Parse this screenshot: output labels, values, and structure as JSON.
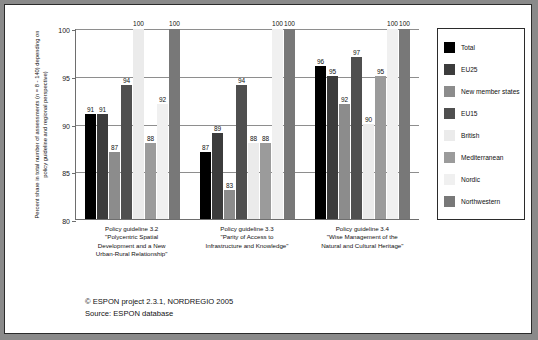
{
  "chart_data": {
    "type": "bar",
    "title": "",
    "xlabel": "",
    "ylabel": "Percent share in total number of assessments (n = 8 - 140) depending on policy guideline and regional perspective)",
    "ylim": [
      80,
      100
    ],
    "yticks": [
      80,
      85,
      90,
      95,
      100
    ],
    "ytick_labels": [
      "80",
      "85",
      "90",
      "95",
      "100"
    ],
    "grid": true,
    "legend_position": "right",
    "categories": [
      "Policy guideline 3.2 \"Polycentric Spatial Development and a New Urban-Rural Relationship\"",
      "Policy guideline 3.3 \"Parity of Access to Infrastructure and Knowledge\"",
      "Policy guideline 3.4 \"Wise Management of the Natural and Cultural Heritage\""
    ],
    "category_lines": [
      [
        "Policy guideline 3.2",
        "\"Polycentric Spatial",
        "Development and a New",
        "Urban-Rural Relationship\""
      ],
      [
        "Policy guideline 3.3",
        "\"Parity of Access to",
        "Infrastructure and Knowledge\""
      ],
      [
        "Policy guideline 3.4",
        "\"Wise Management of the",
        "Natural and Cultural Heritage\""
      ]
    ],
    "series": [
      {
        "name": "Total",
        "color": "#000000",
        "values": [
          91,
          87,
          96
        ]
      },
      {
        "name": "EU25",
        "color": "#3c3c3c",
        "values": [
          91,
          89,
          95
        ]
      },
      {
        "name": "New member states",
        "color": "#8c8c8c",
        "values": [
          87,
          83,
          92
        ]
      },
      {
        "name": "EU15",
        "color": "#4f4f4f",
        "values": [
          94,
          94,
          97
        ]
      },
      {
        "name": "British",
        "color": "#ebebeb",
        "values": [
          100,
          88,
          90
        ]
      },
      {
        "name": "Mediterranean",
        "color": "#9b9b9b",
        "values": [
          88,
          88,
          95
        ]
      },
      {
        "name": "Nordic",
        "color": "#f0f0f0",
        "values": [
          92,
          100,
          100
        ]
      },
      {
        "name": "Northwestern",
        "color": "#787878",
        "values": [
          100,
          100,
          100
        ]
      }
    ]
  },
  "legend": {
    "items": [
      {
        "label": "Total",
        "color": "#000000"
      },
      {
        "label": "EU25",
        "color": "#3c3c3c"
      },
      {
        "label": "New member states",
        "color": "#8c8c8c"
      },
      {
        "label": "EU15",
        "color": "#4f4f4f"
      },
      {
        "label": "British",
        "color": "#ebebeb"
      },
      {
        "label": "Mediterranean",
        "color": "#9b9b9b"
      },
      {
        "label": "Nordic",
        "color": "#f0f0f0"
      },
      {
        "label": "Northwestern",
        "color": "#787878"
      }
    ]
  },
  "footer": {
    "copyright": "© ESPON project 2.3.1, NORDREGIO 2005",
    "source": "Source: ESPON database"
  }
}
